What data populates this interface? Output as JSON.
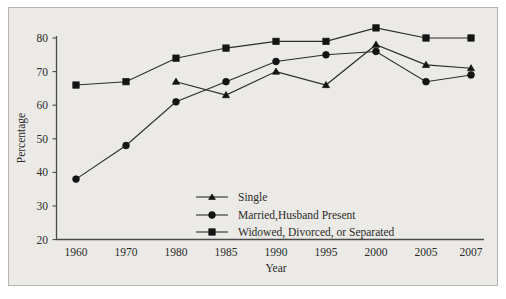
{
  "chart_data": {
    "type": "line",
    "title": "",
    "xlabel": "Year",
    "ylabel": "Percentage",
    "categories": [
      "1960",
      "1970",
      "1980",
      "1985",
      "1990",
      "1995",
      "2000",
      "2005",
      "2007"
    ],
    "ylim": [
      20,
      80
    ],
    "yticks": [
      "20",
      "30",
      "40",
      "50",
      "60",
      "70",
      "80"
    ],
    "grid": false,
    "legend_position": "inside-bottom-center",
    "series": [
      {
        "name": "Single",
        "marker": "triangle",
        "values": [
          null,
          null,
          67,
          63,
          70,
          66,
          78,
          72,
          71
        ]
      },
      {
        "name": "Married,Husband Present",
        "marker": "circle",
        "values": [
          38,
          48,
          61,
          67,
          73,
          75,
          76,
          67,
          69
        ]
      },
      {
        "name": "Widowed, Divorced, or Separated",
        "marker": "square",
        "values": [
          66,
          67,
          74,
          77,
          79,
          79,
          83,
          80,
          80
        ]
      }
    ]
  },
  "axes": {
    "y_title": "Percentage",
    "x_title": "Year",
    "y_ticks": [
      "80",
      "70",
      "60",
      "50",
      "40",
      "30",
      "20"
    ],
    "x_ticks": [
      "1960",
      "1970",
      "1980",
      "1985",
      "1990",
      "1995",
      "2000",
      "2005",
      "2007"
    ]
  },
  "legend": {
    "entries": [
      {
        "label": "Single",
        "marker": "triangle-marker"
      },
      {
        "label": "Married,Husband Present",
        "marker": "circle-marker"
      },
      {
        "label": "Widowed, Divorced, or Separated",
        "marker": "square-marker"
      }
    ]
  },
  "colors": {
    "background": "#eceae6",
    "page": "#ffffff",
    "ink": "#2b2b2b",
    "frame": "#b8b5b0"
  }
}
